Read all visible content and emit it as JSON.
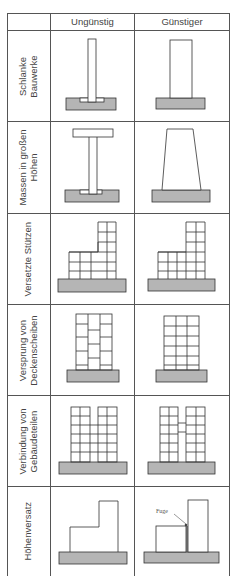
{
  "table": {
    "columns": [
      "",
      "Ungünstig",
      "Günstiger"
    ],
    "rows": [
      {
        "label_line1": "Schlanke",
        "label_line2": "Bauwerke",
        "unfavorable": "slender tall column on footing",
        "favorable": "wider column on footing"
      },
      {
        "label_line1": "Massen in großen",
        "label_line2": "Höhen",
        "unfavorable": "T-shaped structure with heavy top",
        "favorable": "tapered structure wider at base"
      },
      {
        "label_line1": "Versetzte Stützen",
        "label_line2": "",
        "unfavorable": "frame with offset columns",
        "favorable": "frame with continuous columns"
      },
      {
        "label_line1": "Versprung von",
        "label_line2": "Deckenscheiben",
        "unfavorable": "staggered floor slabs",
        "favorable": "aligned floor slabs"
      },
      {
        "label_line1": "Verbindung von",
        "label_line2": "Gebäudeteilen",
        "unfavorable": "two towers connected at all floors",
        "favorable": "two towers with single link"
      },
      {
        "label_line1": "Höhenversatz",
        "label_line2": "",
        "unfavorable": "L-shaped building with height offset",
        "favorable": "separate blocks with joint"
      }
    ]
  },
  "annotations": {
    "joint_label": "Fuge"
  },
  "colors": {
    "grid_line": "#555555",
    "drawing_line": "#333333",
    "foundation_fill": "#b5b5b5",
    "background": "#ffffff"
  }
}
